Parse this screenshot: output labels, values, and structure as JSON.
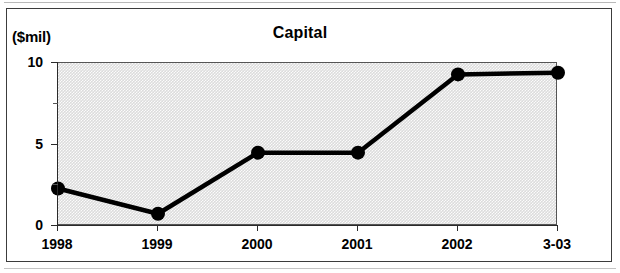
{
  "figure": {
    "units_label": "($mil)",
    "title": "Capital"
  },
  "chart_data": {
    "type": "line",
    "title": "Capital",
    "subtitle": "",
    "xlabel": "",
    "ylabel": "($mil)",
    "units": "$mil",
    "categories": [
      "1998",
      "1999",
      "2000",
      "2001",
      "2002",
      "3-03"
    ],
    "values": [
      2.3,
      0.75,
      4.5,
      4.5,
      9.3,
      9.4
    ],
    "series": [
      {
        "name": "Capital",
        "values": [
          2.3,
          0.75,
          4.5,
          4.5,
          9.3,
          9.4
        ]
      }
    ],
    "ylim": [
      0,
      10
    ],
    "xlim": [
      0,
      5
    ],
    "y_ticks_major": [
      0,
      5,
      10
    ],
    "y_ticks_minor": [
      2.5,
      7.5
    ],
    "y_tick_labels": [
      "0",
      "5",
      "10"
    ],
    "grid": false,
    "legend": false,
    "legend_position": "none",
    "marker": "filled-circle",
    "line_color": "#000000",
    "marker_color": "#000000",
    "plot_background": "#dcdcdc",
    "annotations": []
  },
  "colors": {
    "ink": "#000000",
    "frame": "#3c3c3c",
    "axis": "#2a2a2a",
    "plot_fill": "#dcdcdc"
  }
}
